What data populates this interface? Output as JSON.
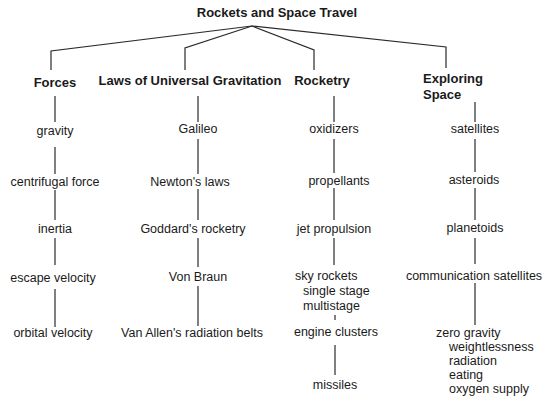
{
  "title": "Rockets and Space Travel",
  "branches": [
    {
      "heading": "Forces",
      "items": [
        "gravity",
        "centrifugal force",
        "inertia",
        "escape velocity",
        "orbital velocity"
      ]
    },
    {
      "heading": "Laws of Universal Gravitation",
      "items": [
        "Galileo",
        "Newton's laws",
        "Goddard's rocketry",
        "Von Braun",
        "Van Allen's radiation belts"
      ]
    },
    {
      "heading": "Rocketry",
      "items": [
        "oxidizers",
        "propellants",
        "jet propulsion",
        "sky rockets",
        "engine clusters",
        "missiles"
      ],
      "sky_rockets_sub": [
        "single stage",
        "multistage"
      ]
    },
    {
      "heading_line1": "Exploring",
      "heading_line2": "Space",
      "items": [
        "satellites",
        "asteroids",
        "planetoids",
        "communication satellites",
        "zero gravity"
      ],
      "zero_gravity_sub": [
        "weightlessness",
        "radiation",
        "eating",
        "oxygen supply"
      ]
    }
  ]
}
